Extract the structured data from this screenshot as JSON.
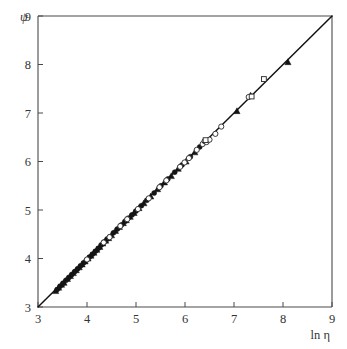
{
  "chart_data": {
    "type": "scatter",
    "title": "",
    "subtitle": "",
    "xlabel": "ln η",
    "ylabel": "ψ",
    "xlim": [
      3,
      9
    ],
    "ylim": [
      3,
      9
    ],
    "xticks": [
      3,
      4,
      5,
      6,
      7,
      8,
      9
    ],
    "yticks": [
      3,
      4,
      5,
      6,
      7,
      8,
      9
    ],
    "xtick_labels": [
      "3",
      "4",
      "5",
      "6",
      "7",
      "8",
      "9"
    ],
    "ytick_labels": [
      "3",
      "4",
      "5",
      "6",
      "7",
      "8",
      "9"
    ],
    "grid": false,
    "legend": null,
    "legend_position": "none",
    "annotations": [],
    "reference_line": {
      "name": "identity-line",
      "description": "1:1 line",
      "slope": 1,
      "intercept": 0,
      "x_start": 3.0,
      "y_start": 3.0,
      "x_end": 9.0,
      "y_end": 9.0,
      "color": "#111111"
    },
    "series": [
      {
        "name": "filled-triangles",
        "marker": "triangle",
        "fill": "solid",
        "color": "#141414",
        "points": [
          [
            3.36,
            3.33
          ],
          [
            3.42,
            3.4
          ],
          [
            3.48,
            3.46
          ],
          [
            3.53,
            3.5
          ],
          [
            3.6,
            3.58
          ],
          [
            3.66,
            3.64
          ],
          [
            3.72,
            3.7
          ],
          [
            3.78,
            3.76
          ],
          [
            3.84,
            3.82
          ],
          [
            3.9,
            3.88
          ],
          [
            3.96,
            3.94
          ],
          [
            4.02,
            4.0
          ],
          [
            4.08,
            4.06
          ],
          [
            4.14,
            4.12
          ],
          [
            4.2,
            4.18
          ],
          [
            4.26,
            4.24
          ],
          [
            4.32,
            4.31
          ],
          [
            4.38,
            4.37
          ],
          [
            4.44,
            4.42
          ],
          [
            4.5,
            4.48
          ],
          [
            4.58,
            4.57
          ],
          [
            4.66,
            4.65
          ],
          [
            4.74,
            4.73
          ],
          [
            4.8,
            4.79
          ],
          [
            4.88,
            4.86
          ],
          [
            4.96,
            4.94
          ],
          [
            5.06,
            5.04
          ],
          [
            5.16,
            5.14
          ],
          [
            5.3,
            5.28
          ],
          [
            5.44,
            5.43
          ],
          [
            5.58,
            5.57
          ],
          [
            5.72,
            5.7
          ],
          [
            5.86,
            5.85
          ],
          [
            6.02,
            6.0
          ],
          [
            6.2,
            6.19
          ],
          [
            7.06,
            7.04
          ],
          [
            7.34,
            7.36
          ],
          [
            8.1,
            8.05
          ]
        ]
      },
      {
        "name": "filled-circles",
        "marker": "circle",
        "fill": "solid",
        "color": "#141414",
        "points": [
          [
            3.39,
            3.36
          ],
          [
            3.45,
            3.43
          ],
          [
            3.51,
            3.49
          ],
          [
            3.57,
            3.55
          ],
          [
            3.63,
            3.61
          ],
          [
            3.69,
            3.67
          ],
          [
            3.75,
            3.73
          ],
          [
            3.81,
            3.79
          ],
          [
            3.87,
            3.85
          ],
          [
            3.93,
            3.91
          ],
          [
            3.99,
            3.97
          ],
          [
            4.05,
            4.03
          ],
          [
            4.11,
            4.09
          ],
          [
            4.17,
            4.15
          ],
          [
            4.23,
            4.21
          ],
          [
            4.29,
            4.28
          ],
          [
            4.35,
            4.34
          ],
          [
            4.41,
            4.4
          ],
          [
            4.47,
            4.45
          ],
          [
            4.54,
            4.53
          ],
          [
            4.62,
            4.61
          ],
          [
            4.7,
            4.69
          ],
          [
            4.78,
            4.77
          ],
          [
            4.84,
            4.83
          ],
          [
            4.92,
            4.9
          ],
          [
            5.0,
            4.98
          ],
          [
            5.11,
            5.09
          ],
          [
            5.22,
            5.2
          ],
          [
            5.37,
            5.35
          ],
          [
            5.51,
            5.5
          ],
          [
            5.65,
            5.64
          ],
          [
            5.79,
            5.78
          ],
          [
            5.94,
            5.93
          ],
          [
            6.11,
            6.1
          ],
          [
            6.3,
            6.3
          ]
        ]
      },
      {
        "name": "open-circles",
        "marker": "circle",
        "fill": "open",
        "color": "#262626",
        "points": [
          [
            4.0,
            3.98
          ],
          [
            4.34,
            4.33
          ],
          [
            4.46,
            4.44
          ],
          [
            4.68,
            4.67
          ],
          [
            4.82,
            4.81
          ],
          [
            5.04,
            5.02
          ],
          [
            5.26,
            5.24
          ],
          [
            5.48,
            5.47
          ],
          [
            5.62,
            5.61
          ],
          [
            5.9,
            5.89
          ],
          [
            5.99,
            5.98
          ],
          [
            6.08,
            6.07
          ],
          [
            6.24,
            6.24
          ],
          [
            6.36,
            6.36
          ],
          [
            6.4,
            6.42
          ],
          [
            6.44,
            6.4
          ],
          [
            6.5,
            6.45
          ],
          [
            6.62,
            6.57
          ],
          [
            6.74,
            6.72
          ],
          [
            7.3,
            7.33
          ]
        ]
      },
      {
        "name": "open-squares",
        "marker": "square",
        "fill": "open",
        "color": "#262626",
        "points": [
          [
            6.42,
            6.44
          ],
          [
            7.36,
            7.34
          ],
          [
            7.61,
            7.7
          ]
        ]
      }
    ]
  },
  "figure": {
    "axis_color": "#4a4a4a",
    "line_color": "#111111",
    "background": "#ffffff"
  }
}
